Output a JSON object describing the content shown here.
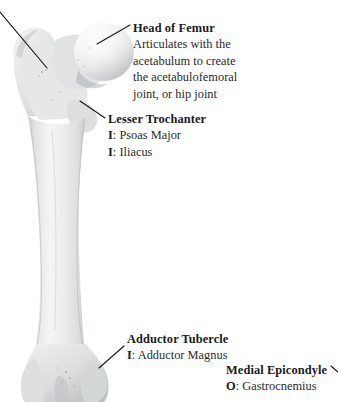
{
  "figure": {
    "background_color": "#ffffff",
    "bone_color": "#e9eaea",
    "bone_shadow_color": "#b9bcbd",
    "leader_line_color": "#1a1a1a"
  },
  "labels": {
    "head_of_femur": {
      "title": "Head of Femur",
      "description_lines": [
        "Articulates with the",
        "acetabulum to create",
        "the acetabulofemoral",
        "joint, or hip joint"
      ]
    },
    "lesser_trochanter": {
      "title": "Lesser Trochanter",
      "attachments": [
        {
          "prefix": "I",
          "sep": ": ",
          "muscle": "Psoas Major"
        },
        {
          "prefix": "I",
          "sep": ": ",
          "muscle": "Iliacus"
        }
      ]
    },
    "adductor_tubercle": {
      "title": "Adductor Tubercle",
      "attachments": [
        {
          "prefix": "I",
          "sep": ": ",
          "muscle": "Adductor Magnus"
        }
      ]
    },
    "medial_epicondyle": {
      "title": "Medial Epicondyle",
      "attachments": [
        {
          "prefix": "O",
          "sep": ": ",
          "muscle": "Gastrocnemius"
        }
      ]
    }
  }
}
